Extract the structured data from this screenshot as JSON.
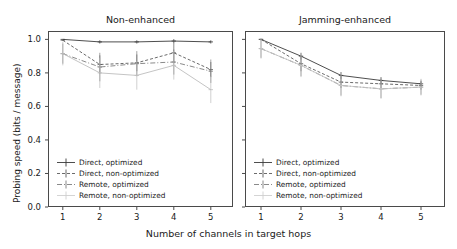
{
  "figure": {
    "xlabel": "Number of channels in target hops",
    "ylabel": "Probing speed (bits / message)",
    "xticks": [
      "1",
      "2",
      "3",
      "4",
      "5"
    ],
    "yticks": [
      "0.0",
      "0.2",
      "0.4",
      "0.6",
      "0.8",
      "1.0"
    ]
  },
  "panels": [
    {
      "title": "Non-enhanced"
    },
    {
      "title": "Jamming-enhanced"
    }
  ],
  "legend": {
    "entries": [
      {
        "label": "Direct, optimized"
      },
      {
        "label": "Direct, non-optimized"
      },
      {
        "label": "Remote, optimized"
      },
      {
        "label": "Remote, non-optimized"
      }
    ]
  },
  "chart_data": {
    "type": "line",
    "title": "",
    "xlabel": "Number of channels in target hops",
    "ylabel": "Probing speed (bits / message)",
    "xlim": [
      0.6,
      5.6
    ],
    "ylim": [
      0.0,
      1.05
    ],
    "xticks": [
      1,
      2,
      3,
      4,
      5
    ],
    "yticks": [
      0.0,
      0.2,
      0.4,
      0.6,
      0.8,
      1.0
    ],
    "grid": false,
    "legend_position": "lower left",
    "subplots": [
      {
        "title": "Non-enhanced",
        "x": [
          1,
          2,
          3,
          4,
          5
        ],
        "series": [
          {
            "name": "Direct, optimized",
            "style": "solid",
            "color": "#3a3a3a",
            "values": [
              1.0,
              0.985,
              0.985,
              0.99,
              0.985
            ],
            "errors": [
              0.0,
              0.01,
              0.01,
              0.012,
              0.01
            ]
          },
          {
            "name": "Direct, non-optimized",
            "style": "dashed",
            "color": "#5a5a5a",
            "values": [
              0.995,
              0.85,
              0.86,
              0.92,
              0.82
            ],
            "errors": [
              0.005,
              0.055,
              0.05,
              0.06,
              0.045
            ]
          },
          {
            "name": "Remote, optimized",
            "style": "dashdot",
            "color": "#7d7d7d",
            "values": [
              0.915,
              0.835,
              0.855,
              0.865,
              0.81
            ],
            "errors": [
              0.06,
              0.085,
              0.075,
              0.075,
              0.07
            ]
          },
          {
            "name": "Remote, non-optimized",
            "style": "light",
            "color": "#bdbdbd",
            "values": [
              0.915,
              0.8,
              0.785,
              0.845,
              0.7
            ],
            "errors": [
              0.07,
              0.09,
              0.085,
              0.085,
              0.08
            ]
          }
        ]
      },
      {
        "title": "Jamming-enhanced",
        "x": [
          1,
          2,
          3,
          4,
          5
        ],
        "series": [
          {
            "name": "Direct, optimized",
            "style": "solid",
            "color": "#3a3a3a",
            "values": [
              1.0,
              0.9,
              0.785,
              0.755,
              0.735
            ],
            "errors": [
              0.0,
              0.02,
              0.02,
              0.02,
              0.015
            ]
          },
          {
            "name": "Direct, non-optimized",
            "style": "dashed",
            "color": "#5a5a5a",
            "values": [
              1.0,
              0.855,
              0.745,
              0.735,
              0.725
            ],
            "errors": [
              0.005,
              0.045,
              0.035,
              0.03,
              0.025
            ]
          },
          {
            "name": "Remote, optimized",
            "style": "dashdot",
            "color": "#7d7d7d",
            "values": [
              0.945,
              0.845,
              0.725,
              0.705,
              0.715
            ],
            "errors": [
              0.055,
              0.065,
              0.06,
              0.055,
              0.045
            ]
          },
          {
            "name": "Remote, non-optimized",
            "style": "light",
            "color": "#c6c6c6",
            "values": [
              0.945,
              0.845,
              0.725,
              0.705,
              0.715
            ],
            "errors": [
              0.06,
              0.07,
              0.065,
              0.06,
              0.05
            ]
          }
        ]
      }
    ]
  }
}
